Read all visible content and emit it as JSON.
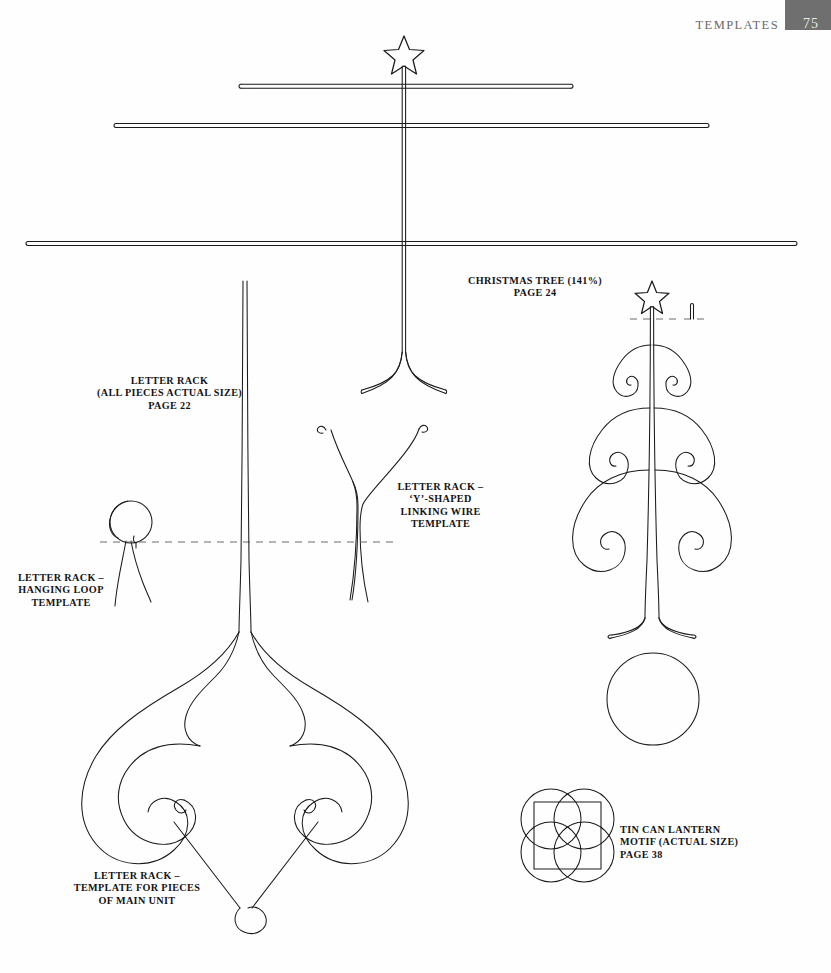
{
  "page": {
    "running_head": "TEMPLATES",
    "folio": "75",
    "folio_box_color": "#6f6f6f",
    "background_color": "#fefefe",
    "ink_color": "#1b1b1b",
    "dash_color": "#6b6b6b"
  },
  "captions": {
    "christmas_tree": "CHRISTMAS TREE (141%)\nPAGE 24",
    "letter_rack_all": "LETTER RACK\n(ALL PIECES ACTUAL SIZE)\nPAGE 22",
    "letter_rack_y": "LETTER RACK –\n‘Y’-SHAPED\nLINKING WIRE\nTEMPLATE",
    "letter_rack_loop": "LETTER RACK –\nHANGING LOOP\nTEMPLATE",
    "letter_rack_main": "LETTER RACK –\nTEMPLATE FOR PIECES\nOF MAIN UNIT",
    "tin_can_lantern": "TIN CAN LANTERN\nMOTIF (ACTUAL SIZE)\nPAGE 38"
  },
  "figures": [
    {
      "name": "christmas-tree-large-template",
      "label": "Christmas tree enlarged template with star finial, three horizontal branch bars and flared footed base"
    },
    {
      "name": "christmas-tree-small-figure",
      "label": "Scrolled wire Christmas tree with star finial and spiral branches"
    },
    {
      "name": "letter-rack-main-unit-template",
      "label": "Ornate fleur-de-lis scrollwork main unit template"
    },
    {
      "name": "letter-rack-y-wire-template",
      "label": "Y shaped linking wire template with curled tips"
    },
    {
      "name": "letter-rack-hanging-loop-template",
      "label": "Hanging loop template with circular loop and splayed legs"
    },
    {
      "name": "tin-can-lantern-motif",
      "label": "Square motif formed by four interlocking circles"
    },
    {
      "name": "base-circle",
      "label": "Plain circle base template"
    }
  ],
  "icons": {
    "star": "star-icon",
    "spiral": "spiral-icon",
    "circle": "circle-icon"
  }
}
